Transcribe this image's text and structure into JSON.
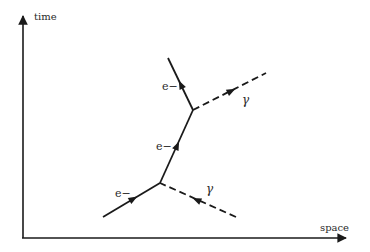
{
  "diagram": {
    "type": "feynman-diagram",
    "axes": {
      "x_label": "space",
      "y_label": "time"
    },
    "labels": {
      "electron_in": "e−",
      "electron_mid": "e−",
      "electron_out": "e−",
      "photon_in": "γ",
      "photon_out": "γ"
    },
    "vertices": [
      {
        "id": "v1",
        "x": 160,
        "y": 183
      },
      {
        "id": "v2",
        "x": 193,
        "y": 110
      }
    ],
    "lines": [
      {
        "id": "electron-in",
        "kind": "electron",
        "style": "solid",
        "from": [
          103,
          217
        ],
        "to": [
          160,
          183
        ]
      },
      {
        "id": "electron-mid",
        "kind": "electron",
        "style": "solid",
        "from": [
          160,
          183
        ],
        "to": [
          193,
          110
        ]
      },
      {
        "id": "electron-out",
        "kind": "electron",
        "style": "solid",
        "from": [
          193,
          110
        ],
        "to": [
          168,
          58
        ]
      },
      {
        "id": "photon-in",
        "kind": "photon",
        "style": "dashed",
        "from": [
          236,
          217
        ],
        "to": [
          160,
          183
        ]
      },
      {
        "id": "photon-out",
        "kind": "photon",
        "style": "dashed",
        "from": [
          193,
          110
        ],
        "to": [
          266,
          73
        ]
      }
    ],
    "colors": {
      "line": "#1a1a1a",
      "text": "#2a2a2a",
      "background": "#ffffff"
    }
  }
}
